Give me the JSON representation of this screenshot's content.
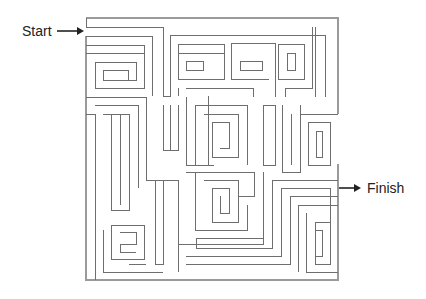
{
  "diagram": {
    "type": "maze",
    "labels": {
      "start": "Start",
      "finish": "Finish"
    },
    "colors": {
      "background": "#ffffff",
      "wall": "#6e6e6e",
      "outer_wall": "#9a9a9a",
      "arrow": "#222222",
      "text": "#222222"
    },
    "icons": {
      "start_arrow": "right-arrow-icon",
      "finish_arrow": "right-arrow-icon"
    }
  }
}
